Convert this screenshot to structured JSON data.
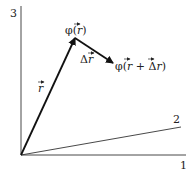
{
  "axes": {
    "axis1_label": "1",
    "axis2_label": "2",
    "axis3_label": "3"
  },
  "vectors": {
    "r": {
      "label_base": "r"
    },
    "delta_r": {
      "label_prefix": "Δ",
      "label_base": "r"
    }
  },
  "points": {
    "phi_r": {
      "prefix": "φ(",
      "var": "r",
      "suffix": ")"
    },
    "phi_r_plus_dr": {
      "prefix": "φ(",
      "var1": "r",
      "mid": " + Δ",
      "var2": "r",
      "suffix": ")"
    }
  },
  "colors": {
    "line": "#333333",
    "vector": "#111111",
    "background": "#ffffff"
  }
}
